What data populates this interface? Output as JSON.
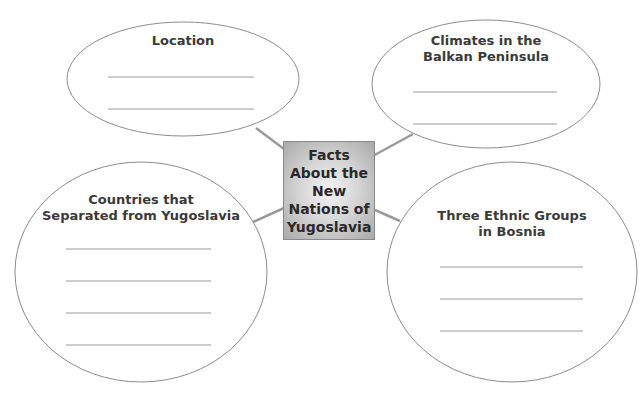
{
  "center": {
    "title": "Facts About the New Nations of Yugoslavia"
  },
  "bubbles": [
    {
      "id": "location",
      "title_lines": [
        "Location"
      ],
      "blank_lines": 2
    },
    {
      "id": "climates",
      "title_lines": [
        "Climates in the",
        "Balkan Peninsula"
      ],
      "blank_lines": 2
    },
    {
      "id": "countries",
      "title_lines": [
        "Countries that",
        "Separated from Yugoslavia"
      ],
      "blank_lines": 4
    },
    {
      "id": "ethnic",
      "title_lines": [
        "Three Ethnic Groups",
        "in Bosnia"
      ],
      "blank_lines": 3
    }
  ],
  "colors": {
    "outline": "#8c8c8c",
    "connector": "#9a9a9a",
    "blank_line": "#9a9a9a",
    "center_fill_light": "#f4f4f4",
    "center_fill_dark": "#a9a9a9",
    "text": "#3a3a3a"
  }
}
